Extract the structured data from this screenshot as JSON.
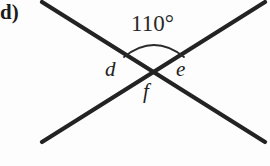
{
  "figure": {
    "part_label": "d)",
    "angle_label": "110°",
    "variables": {
      "left": "d",
      "right": "e",
      "bottom": "f"
    },
    "colors": {
      "background": "#fdfdfd",
      "line": "#232323",
      "text": "#1c1c1c",
      "arc": "#2a2a2a"
    },
    "geometry": {
      "intersection_x": 154,
      "intersection_y": 68,
      "line_a_start_x": 42,
      "line_a_start_y": 2,
      "line_a_end_x": 265,
      "line_a_end_y": 142,
      "line_b_start_x": 42,
      "line_b_start_y": 142,
      "line_b_end_x": 265,
      "line_b_end_y": 2,
      "line_width": 4,
      "arc_left_x": 124,
      "arc_left_y": 57,
      "arc_right_x": 184,
      "arc_right_y": 57,
      "arc_peak_y": 40
    }
  }
}
